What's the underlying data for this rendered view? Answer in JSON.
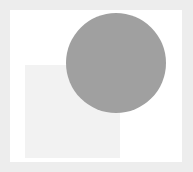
{
  "figure": {
    "width_px": 193,
    "height_px": 172,
    "background_color": "#ededed",
    "panel_color": "#ffffff",
    "panel_left_px": 10,
    "panel_top_px": 10,
    "panel_width_px": 172,
    "panel_height_px": 152,
    "title": "",
    "axis_labels_visible": "none",
    "tick_labels_visible": "none",
    "legend_visible": "none"
  },
  "chart_data": {
    "type": "scatter",
    "title": "",
    "subtitle": "",
    "xlabel": "",
    "ylabel": "",
    "xlim": [
      0,
      172
    ],
    "ylim": [
      0,
      152
    ],
    "grid": false,
    "legend": "none",
    "annotations": [],
    "tick_labels_x": [],
    "tick_labels_y": [],
    "shapes": [
      {
        "name": "square",
        "kind": "rectangle",
        "color": "#f2f2f2",
        "x_px": 25,
        "y_px": 65,
        "width_px": 95,
        "height_px": 93,
        "z_order": 1,
        "label": ""
      },
      {
        "name": "circle",
        "kind": "circle",
        "color": "#a0a0a0",
        "center_x_px": 116,
        "center_y_px": 63,
        "diameter_px": 100,
        "radius_px": 50,
        "z_order": 2,
        "label": ""
      }
    ]
  }
}
